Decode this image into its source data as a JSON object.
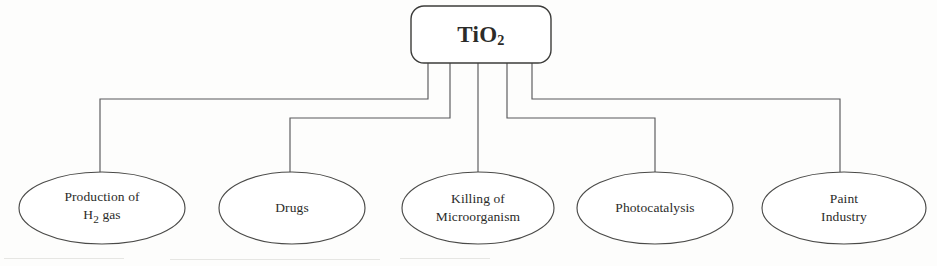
{
  "diagram": {
    "type": "tree",
    "title_node": {
      "id": "tio2-root",
      "label": "TiO2",
      "label_base": "TiO",
      "label_sub": "2",
      "shape": "rounded-rectangle",
      "x": 411,
      "y": 6,
      "width": 140,
      "height": 57,
      "corner_radius": 13
    },
    "edge_color": "#59595a",
    "node_stroke_color": "#4a4a48",
    "node_fill_color": "#ffffff",
    "background_color": "#fdfdfc",
    "leaves": [
      {
        "id": "production-of-h2-gas",
        "lines": [
          "Production of",
          "H2 gas"
        ],
        "line1": "Production of",
        "line2_base": "H",
        "line2_sub": "2",
        "line2_rest": " gas",
        "shape": "ellipse",
        "cx": 102,
        "cy": 208,
        "rx": 83,
        "ry": 36,
        "stub_x": 428,
        "rail_y": 99,
        "corner_x": 100
      },
      {
        "id": "drugs",
        "lines": [
          "Drugs"
        ],
        "line1": "Drugs",
        "shape": "ellipse",
        "cx": 292,
        "cy": 208,
        "rx": 73,
        "ry": 36,
        "stub_x": 450,
        "rail_y": 118,
        "corner_x": 290
      },
      {
        "id": "killing-of-microorganism",
        "lines": [
          "Killing of",
          "Microorganism"
        ],
        "line1": "Killing of",
        "line2": "Microorganism",
        "shape": "ellipse",
        "cx": 478,
        "cy": 208,
        "rx": 76,
        "ry": 36,
        "stub_x": 478,
        "rail_y": 63,
        "corner_x": 478
      },
      {
        "id": "photocatalysis",
        "lines": [
          "Photocatalysis"
        ],
        "line1": "Photocatalysis",
        "shape": "ellipse",
        "cx": 655,
        "cy": 208,
        "rx": 78,
        "ry": 36,
        "stub_x": 507,
        "rail_y": 118,
        "corner_x": 655
      },
      {
        "id": "paint-industry",
        "lines": [
          "Paint",
          "Industry"
        ],
        "line1": "Paint",
        "line2": "Industry",
        "shape": "ellipse",
        "cx": 844,
        "cy": 208,
        "rx": 82,
        "ry": 36,
        "stub_x": 532,
        "rail_y": 99,
        "corner_x": 840
      }
    ]
  }
}
